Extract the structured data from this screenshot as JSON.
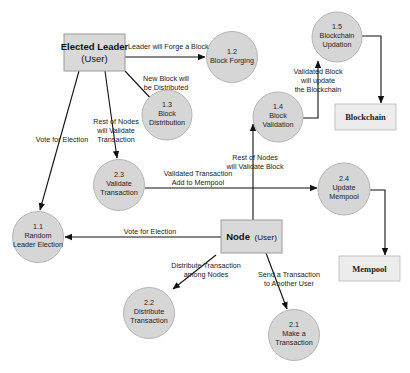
{
  "diagram": {
    "type": "data-flow-diagram",
    "colors": {
      "process_fill": "#d6d6d6",
      "process_stroke": "#b5b5b5",
      "entity_fill": "#d9d9d9",
      "entity_stroke": "#9a9a9a",
      "store_fill": "#ececec",
      "arrow": "#111111"
    },
    "entities": {
      "elected_leader": {
        "title": "Elected Leader",
        "subtitle": "(User)"
      },
      "node": {
        "title": "Node",
        "subtitle": "(User)"
      }
    },
    "stores": {
      "blockchain": {
        "label": "Blockchain"
      },
      "mempool": {
        "label": "Mempool"
      }
    },
    "processes": {
      "p1_1": {
        "id": "1.1",
        "line1": "Random",
        "line2": "Leader Election"
      },
      "p1_2": {
        "id": "1.2",
        "line1": "Block Forging"
      },
      "p1_3": {
        "id": "1.3",
        "line1": "Block",
        "line2": "Distribution"
      },
      "p1_4": {
        "id": "1.4",
        "line1": "Block",
        "line2": "Validation"
      },
      "p1_5": {
        "id": "1.5",
        "line1": "Blockchain",
        "line2": "Updation"
      },
      "p2_1": {
        "id": "2.1",
        "line1": "Make a",
        "line2": "Transaction"
      },
      "p2_2": {
        "id": "2.2",
        "line1": "Distribute",
        "line2": "Transaction"
      },
      "p2_3": {
        "id": "2.3",
        "line1": "Validate",
        "line2": "Transaction"
      },
      "p2_4": {
        "id": "2.4",
        "line1": "Update",
        "line2": "Mempool"
      }
    },
    "flows": {
      "forge": {
        "line1": "Leader will Forge a Block"
      },
      "distribute_block": {
        "line1": "New Block will",
        "line2": "be Distributed"
      },
      "vote_leader": {
        "line1": "Vote for Election"
      },
      "validate_tx": {
        "line1": "Rest of Nodes",
        "line2": "will Validate",
        "line3": "Transaction"
      },
      "validated_block": {
        "line1": "Validated Block",
        "line2": "will update",
        "line3": "the Blockchain"
      },
      "validate_block": {
        "line1": "Rest of Nodes",
        "line2": "will Validate Block"
      },
      "validated_tx": {
        "line1": "Validated Transaction",
        "line2": "Add to Mempool"
      },
      "vote_node": {
        "line1": "Vote for Election"
      },
      "distribute_tx": {
        "line1": "Distribute Transaction",
        "line2": "among Nodes"
      },
      "send_tx": {
        "line1": "Send a Transaction",
        "line2": "to Another User"
      }
    }
  }
}
